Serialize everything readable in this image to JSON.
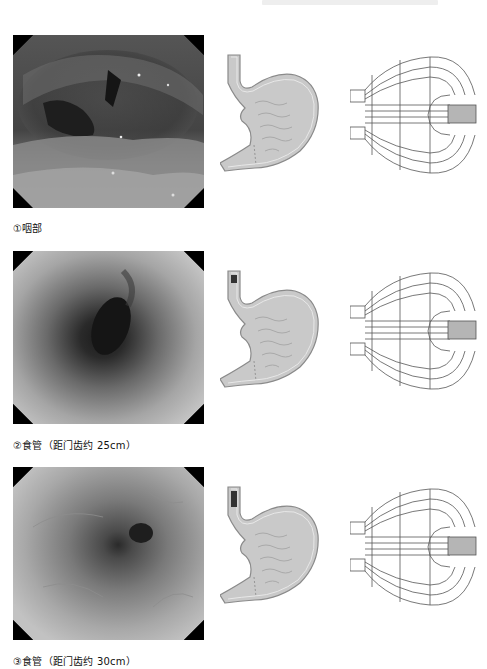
{
  "page": {
    "header_text": ""
  },
  "rows": [
    {
      "caption": "①咽部",
      "image_label": "pharynx endoscopic view",
      "scope_position": "pharynx",
      "marker": false
    },
    {
      "caption": "②食管（距门齿约 25cm）",
      "image_label": "esophagus endoscopic view at 25cm",
      "scope_position": "esophagus-25cm",
      "marker": true
    },
    {
      "caption": "③食管（距门齿约 30cm）",
      "image_label": "esophagus endoscopic view at 30cm",
      "scope_position": "esophagus-30cm",
      "marker": true
    }
  ],
  "colors": {
    "stomach_fill": "#c9c9c9",
    "stomach_outline": "#8a8a8a",
    "marker": "#333333",
    "schema_line": "#555555",
    "schema_tube": "#b5b5b5"
  }
}
